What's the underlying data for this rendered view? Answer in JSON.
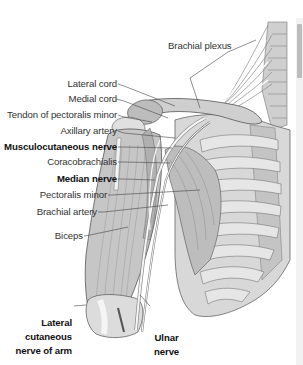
{
  "figure": {
    "type": "anatomical illustration"
  },
  "labels": {
    "brachial_plexus": "Brachial plexus",
    "lateral_cord": "Lateral cord",
    "medial_cord": "Medial cord",
    "tendon_pectoralis_minor": "Tendon of pectoralis minor",
    "axillary_artery": "Axillary artery",
    "musculocutaneous_nerve": "Musculocutaneous nerve",
    "coracobrachialis": "Coracobrachialis",
    "median_nerve": "Median nerve",
    "pectoralis_minor": "Pectoralis minor",
    "brachial_artery": "Brachial artery",
    "biceps": "Biceps",
    "lateral_cutaneous_nerve": "Lateral\ncutaneous\nnerve of arm",
    "ulnar_nerve": "Ulnar\nnerve"
  },
  "bold_labels": [
    "Musculocutaneous nerve",
    "Median nerve",
    "Lateral cutaneous nerve of arm",
    "Ulnar nerve"
  ],
  "colors": {
    "muscle": "#c9c9c9",
    "muscle_dark": "#a8a8a8",
    "bone": "#e4e4e4",
    "nerve": "#f7f7f7",
    "outline": "#666666",
    "leader": "#444444",
    "text": "#333333"
  }
}
